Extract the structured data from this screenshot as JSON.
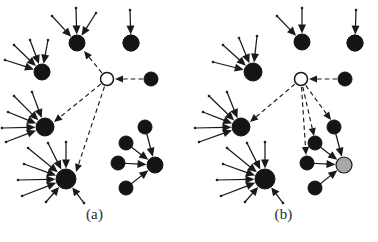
{
  "figure": {
    "width": 378,
    "height": 242,
    "background": "#ffffff",
    "ink_color": "#1a1a1a",
    "node_fill_dark": "#141414",
    "node_fill_hollow": "#ffffff",
    "node_fill_gray": "#a8a8a8",
    "edge_solid_color": "#1a1a1a",
    "edge_dashed_color": "#1a1a1a"
  },
  "panels": [
    {
      "id": "a",
      "caption": "(a)",
      "hub": {
        "cx": 107,
        "cy": 79,
        "r": 6.5,
        "style": "hollow"
      },
      "clusters": [
        {
          "name": "cluster-top",
          "center": {
            "cx": 77,
            "cy": 43,
            "r": 8
          },
          "leaves": [
            {
              "x": 52,
              "y": 16
            },
            {
              "x": 76,
              "y": 8
            },
            {
              "x": 96,
              "y": 13
            }
          ]
        },
        {
          "name": "cluster-upper-left",
          "center": {
            "cx": 42,
            "cy": 72,
            "r": 8
          },
          "leaves": [
            {
              "x": 14,
              "y": 45
            },
            {
              "x": 30,
              "y": 40
            },
            {
              "x": 48,
              "y": 40
            },
            {
              "x": 5,
              "y": 60
            }
          ]
        },
        {
          "name": "cluster-mid-left",
          "center": {
            "cx": 45,
            "cy": 127,
            "r": 9
          },
          "leaves": [
            {
              "x": 14,
              "y": 96
            },
            {
              "x": 32,
              "y": 92
            },
            {
              "x": 8,
              "y": 112
            },
            {
              "x": 2,
              "y": 128
            },
            {
              "x": 6,
              "y": 142
            }
          ]
        },
        {
          "name": "cluster-lower-left",
          "center": {
            "cx": 66,
            "cy": 179,
            "r": 10
          },
          "leaves": [
            {
              "x": 28,
              "y": 148
            },
            {
              "x": 48,
              "y": 143
            },
            {
              "x": 66,
              "y": 142
            },
            {
              "x": 24,
              "y": 164
            },
            {
              "x": 18,
              "y": 180
            },
            {
              "x": 22,
              "y": 196
            },
            {
              "x": 46,
              "y": 202
            },
            {
              "x": 84,
              "y": 203
            }
          ]
        },
        {
          "name": "cluster-right-star",
          "center": {
            "cx": 155,
            "cy": 165,
            "r": 8
          },
          "leaves": [
            {
              "x": 145,
              "y": 127
            },
            {
              "x": 126,
              "y": 143
            },
            {
              "x": 118,
              "y": 163
            },
            {
              "x": 126,
              "y": 188
            }
          ]
        },
        {
          "name": "isolated-top-right",
          "center": {
            "cx": 131,
            "cy": 43,
            "r": 8
          },
          "leaves": [
            {
              "x": 130,
              "y": 10
            }
          ]
        }
      ],
      "incoming_dashed": [
        {
          "from": {
            "x": 151,
            "y": 79
          },
          "to": {
            "x": 114,
            "y": 79
          },
          "source_node_r": 7
        }
      ],
      "outgoing_dashed": [
        {
          "to_cluster": "cluster-top",
          "tx": 84,
          "ty": 51
        },
        {
          "to_cluster": "cluster-mid-left",
          "tx": 54,
          "ty": 122
        },
        {
          "to_cluster": "cluster-lower-left",
          "tx": 76,
          "ty": 172
        }
      ]
    },
    {
      "id": "b",
      "caption": "(b)",
      "hub": {
        "cx": 112,
        "cy": 79,
        "r": 6.5,
        "style": "hollow"
      },
      "clusters": [
        {
          "name": "cluster-top",
          "center": {
            "cx": 113,
            "cy": 42,
            "r": 8
          },
          "leaves": [
            {
              "x": 88,
              "y": 16
            },
            {
              "x": 113,
              "y": 8
            }
          ]
        },
        {
          "name": "isolated-top-right",
          "center": {
            "cx": 166,
            "cy": 43,
            "r": 8
          },
          "leaves": [
            {
              "x": 167,
              "y": 10
            }
          ]
        },
        {
          "name": "cluster-upper-left",
          "center": {
            "cx": 64,
            "cy": 72,
            "r": 9
          },
          "leaves": [
            {
              "x": 34,
              "y": 45
            },
            {
              "x": 50,
              "y": 38
            },
            {
              "x": 68,
              "y": 36
            },
            {
              "x": 24,
              "y": 62
            }
          ]
        },
        {
          "name": "cluster-mid-left",
          "center": {
            "cx": 52,
            "cy": 127,
            "r": 9
          },
          "leaves": [
            {
              "x": 20,
              "y": 96
            },
            {
              "x": 38,
              "y": 92
            },
            {
              "x": 14,
              "y": 112
            },
            {
              "x": 6,
              "y": 128
            },
            {
              "x": 10,
              "y": 142
            }
          ]
        },
        {
          "name": "cluster-lower-left",
          "center": {
            "cx": 76,
            "cy": 179,
            "r": 10
          },
          "leaves": [
            {
              "x": 38,
              "y": 148
            },
            {
              "x": 58,
              "y": 143
            },
            {
              "x": 76,
              "y": 142
            },
            {
              "x": 34,
              "y": 164
            },
            {
              "x": 28,
              "y": 180
            },
            {
              "x": 32,
              "y": 196
            },
            {
              "x": 56,
              "y": 202
            },
            {
              "x": 94,
              "y": 203
            }
          ]
        },
        {
          "name": "cluster-right-star",
          "center": {
            "cx": 155,
            "cy": 165,
            "r": 8,
            "style": "gray"
          },
          "leaves": [
            {
              "x": 145,
              "y": 127
            },
            {
              "x": 126,
              "y": 143
            },
            {
              "x": 118,
              "y": 163
            },
            {
              "x": 126,
              "y": 188
            }
          ]
        }
      ],
      "incoming_dashed": [
        {
          "from": {
            "x": 156,
            "y": 79
          },
          "to": {
            "x": 119,
            "y": 79
          },
          "source_node_r": 7
        }
      ],
      "outgoing_dashed": [
        {
          "to_cluster": "cluster-mid-left",
          "tx": 61,
          "ty": 122
        },
        {
          "to_cluster": "star-leaf-0",
          "tx": 142,
          "ty": 120
        },
        {
          "to_cluster": "star-leaf-1",
          "tx": 125,
          "ty": 136
        },
        {
          "to_cluster": "star-leaf-2",
          "tx": 117,
          "ty": 155
        }
      ]
    }
  ],
  "legend_semantics": {
    "hollow_node": "query/seed node",
    "dark_node": "regular node",
    "gray_node": "highlighted cluster center",
    "solid_edge": "intra-cluster edge",
    "dashed_edge": "inter-cluster edge"
  }
}
